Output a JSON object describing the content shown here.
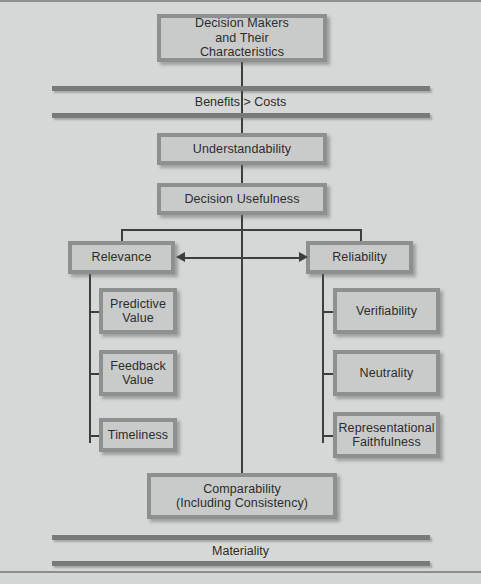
{
  "figure": {
    "background_color": "#d5d7d6",
    "box_fill_color": "#c9cbca",
    "box_border_color": "#8d908f",
    "line_color": "#3d3f3e",
    "band_color": "#77797a"
  },
  "nodes": {
    "decision_makers": {
      "line1": "Decision Makers",
      "line2": "and Their Characteristics"
    },
    "understandability": {
      "label": "Understandability"
    },
    "decision_usefulness": {
      "label": "Decision Usefulness"
    },
    "relevance": {
      "label": "Relevance"
    },
    "reliability": {
      "label": "Reliability"
    },
    "predictive_value": {
      "line1": "Predictive",
      "line2": "Value"
    },
    "feedback_value": {
      "line1": "Feedback",
      "line2": "Value"
    },
    "timeliness": {
      "label": "Timeliness"
    },
    "verifiability": {
      "label": "Verifiability"
    },
    "neutrality": {
      "label": "Neutrality"
    },
    "representational_faithfulness": {
      "line1": "Representational",
      "line2": "Faithfulness"
    },
    "comparability": {
      "line1": "Comparability",
      "line2": "(Including Consistency)"
    }
  },
  "bands": {
    "benefits_costs": {
      "label": "Benefits > Costs"
    },
    "materiality": {
      "label": "Materiality"
    }
  },
  "connectors": {
    "relevance_reliability_arrow": {
      "type": "double-headed-arrow"
    }
  }
}
